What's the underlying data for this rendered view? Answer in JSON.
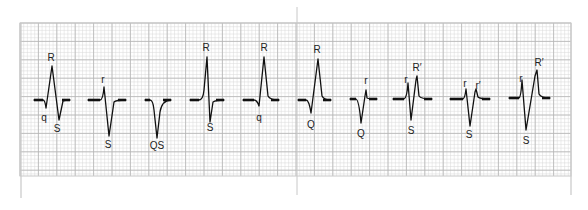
{
  "figure": {
    "colors": {
      "background": "#ffffff",
      "grid_minor": "#d9d9d9",
      "grid_major": "#b5b5b5",
      "frame": "#c8c8c8",
      "trace": "#111111",
      "label": "#222222"
    },
    "grid": {
      "x0": 20,
      "y0": 23,
      "x1": 571,
      "y1": 176,
      "minor": 3.68,
      "major": 18.4
    },
    "divider_x": 297,
    "baseline_y": 100,
    "complexes": [
      {
        "name": "qRS",
        "path": "M34,100 L43,100 Q45,100 46,108 L52,66 L59,120 L63,101 Q65,100 70,100",
        "labels": [
          {
            "text": "R",
            "x": 51,
            "y": 61
          },
          {
            "text": "q",
            "x": 44,
            "y": 121
          },
          {
            "text": "S",
            "x": 57,
            "y": 132
          }
        ]
      },
      {
        "name": "rS",
        "path": "M88,100 L100,100 Q103,100 104,87 L109,136 L114,102 Q116,100 126,100",
        "labels": [
          {
            "text": "r",
            "x": 103,
            "y": 83
          },
          {
            "text": "S",
            "x": 108,
            "y": 148
          }
        ]
      },
      {
        "name": "QS",
        "path": "M145,100 L150,100 Q153,100 154,110 L157,138 L160,112 Q162,100 171,100",
        "labels": [
          {
            "text": "QS",
            "x": 157,
            "y": 149
          }
        ]
      },
      {
        "name": "RS",
        "path": "M190,100 L199,100 Q203,100 204,90 L207,57 L210,122 L213,102 Q216,100 224,100",
        "labels": [
          {
            "text": "R",
            "x": 206,
            "y": 51
          },
          {
            "text": "S",
            "x": 210,
            "y": 131
          }
        ]
      },
      {
        "name": "qR",
        "path": "M243,100 L254,100 Q257,100 259,106 L264,57 L268,96 Q270,100 279,100",
        "labels": [
          {
            "text": "R",
            "x": 264,
            "y": 51
          },
          {
            "text": "q",
            "x": 259,
            "y": 121
          }
        ]
      },
      {
        "name": "QR",
        "path": "M298,100 L306,100 Q309,100 311,113 L318,59 L322,96 Q324,100 331,100",
        "labels": [
          {
            "text": "R",
            "x": 317,
            "y": 53
          },
          {
            "text": "Q",
            "x": 311,
            "y": 128
          }
        ]
      },
      {
        "name": "Qr",
        "path": "M350,99 L356,99 Q359,100 361,123 L365,96 L366,90 L367,98 Q369,99 377,99",
        "labels": [
          {
            "text": "r",
            "x": 366,
            "y": 84
          },
          {
            "text": "Q",
            "x": 361,
            "y": 137
          }
        ]
      },
      {
        "name": "rSR'",
        "path": "M393,99 L404,99 Q407,98 408,83 L411,120 L416,80 L417,76 L419,96 Q421,99 432,99",
        "labels": [
          {
            "text": "r",
            "x": 406,
            "y": 83
          },
          {
            "text": "R′",
            "x": 417,
            "y": 71
          },
          {
            "text": "S",
            "x": 411,
            "y": 134
          }
        ]
      },
      {
        "name": "rSr'",
        "path": "M450,99 L463,99 Q465,98 466,89 L470,126 L475,92 L476,89 L478,97 Q480,99 490,99",
        "labels": [
          {
            "text": "r",
            "x": 465,
            "y": 87
          },
          {
            "text": "r′",
            "x": 478,
            "y": 89
          },
          {
            "text": "S",
            "x": 469,
            "y": 138
          }
        ]
      },
      {
        "name": "rSR' (tall)",
        "path": "M509,98 L519,98 Q521,97 522,80 L526,130 L535,76 L537,70 L539,94 Q541,98 550,98",
        "labels": [
          {
            "text": "r",
            "x": 521,
            "y": 82
          },
          {
            "text": "R′",
            "x": 539,
            "y": 66
          },
          {
            "text": "S",
            "x": 526,
            "y": 144
          }
        ]
      }
    ]
  }
}
